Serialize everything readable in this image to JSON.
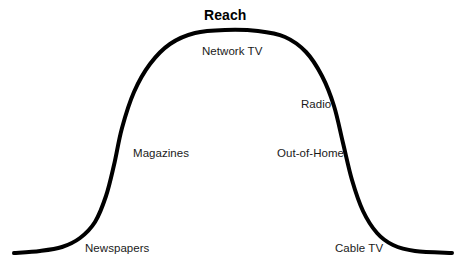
{
  "chart_data": {
    "type": "line",
    "title": "Reach",
    "subtitle": "",
    "xlabel": "",
    "ylabel": "",
    "grid": false,
    "legend": "none",
    "axis_visible": false,
    "curve_color": "#000000",
    "curve_width_px": 4,
    "background_color": "#ffffff",
    "xlim": [
      0,
      462
    ],
    "ylim": [
      279,
      0
    ],
    "categories": [
      "Newspapers",
      "Magazines",
      "Network TV",
      "Radio",
      "Out-of-Home",
      "Cable TV"
    ],
    "values": [
      8,
      48,
      100,
      72,
      38,
      8
    ],
    "annotations": [
      {
        "text": "Network TV",
        "x": 202,
        "y": 46
      },
      {
        "text": "Radio",
        "x": 301,
        "y": 99
      },
      {
        "text": "Magazines",
        "x": 133,
        "y": 148
      },
      {
        "text": "Out-of-Home",
        "x": 277,
        "y": 148
      },
      {
        "text": "Newspapers",
        "x": 85,
        "y": 243
      },
      {
        "text": "Cable TV",
        "x": 335,
        "y": 243
      }
    ],
    "points": [
      {
        "x": 14,
        "y": 253
      },
      {
        "x": 40,
        "y": 251
      },
      {
        "x": 62,
        "y": 247
      },
      {
        "x": 80,
        "y": 238
      },
      {
        "x": 95,
        "y": 222
      },
      {
        "x": 106,
        "y": 196
      },
      {
        "x": 114,
        "y": 165
      },
      {
        "x": 122,
        "y": 128
      },
      {
        "x": 134,
        "y": 92
      },
      {
        "x": 150,
        "y": 64
      },
      {
        "x": 170,
        "y": 44
      },
      {
        "x": 195,
        "y": 33
      },
      {
        "x": 225,
        "y": 30
      },
      {
        "x": 258,
        "y": 31
      },
      {
        "x": 285,
        "y": 37
      },
      {
        "x": 306,
        "y": 52
      },
      {
        "x": 322,
        "y": 76
      },
      {
        "x": 334,
        "y": 106
      },
      {
        "x": 343,
        "y": 143
      },
      {
        "x": 352,
        "y": 180
      },
      {
        "x": 363,
        "y": 211
      },
      {
        "x": 377,
        "y": 233
      },
      {
        "x": 393,
        "y": 245
      },
      {
        "x": 415,
        "y": 251
      },
      {
        "x": 452,
        "y": 253
      }
    ]
  },
  "chart": {
    "title": "Reach",
    "labels": {
      "newspapers": "Newspapers",
      "magazines": "Magazines",
      "network_tv": "Network TV",
      "radio": "Radio",
      "out_of_home": "Out-of-Home",
      "cable_tv": "Cable TV"
    }
  }
}
